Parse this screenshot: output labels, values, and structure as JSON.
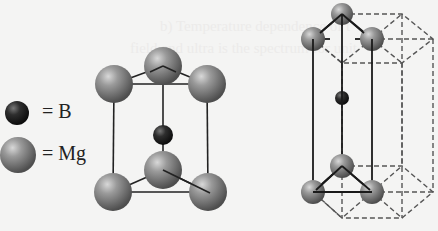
{
  "figure": {
    "legend": [
      {
        "symbol": "B",
        "label": "= B",
        "color": "#2a2a2a"
      },
      {
        "symbol": "Mg",
        "label": "= Mg",
        "color": "#8a8a8a"
      }
    ],
    "ghost_text": [
      "b) Temperature  dependence  of  t",
      "field  and  ultra  is  the  spectrum  for  unit"
    ],
    "structures": [
      {
        "name": "unit-cell",
        "description": "Mg atoms at corners of triangular prism with B at center"
      },
      {
        "name": "hexagonal-prism",
        "description": "Extended hexagonal lattice with dashed outline"
      }
    ]
  }
}
